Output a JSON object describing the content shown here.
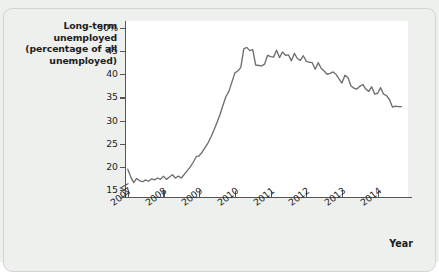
{
  "figure": {
    "background_color": "#eef0ee",
    "plot_background_color": "#ffffff",
    "axis_color": "#565656",
    "line_color": "#6e6e6e",
    "text_color": "#1d1d1d"
  },
  "chart_data": {
    "type": "line",
    "title": "",
    "ylabel": "Long-term unemployed (percentage of all unemployed)",
    "ylabel_lines": [
      "Long-term unemployed",
      "(percentage of all",
      "unemployed)"
    ],
    "xlabel": "Year",
    "ytick_labels": [
      "50%",
      "45",
      "40",
      "35",
      "30",
      "25",
      "20",
      "15"
    ],
    "ytick_values": [
      50,
      45,
      40,
      35,
      30,
      25,
      20,
      15
    ],
    "ylim": [
      13.5,
      51.5
    ],
    "y_axis_broken": true,
    "xtick_labels": [
      "2007",
      "2008",
      "2009",
      "2010",
      "2011",
      "2012",
      "2013",
      "2014"
    ],
    "xtick_values": [
      2007,
      2008,
      2009,
      2010,
      2011,
      2012,
      2013,
      2014
    ],
    "xlim": [
      2006.95,
      2014.85
    ],
    "grid": false,
    "legend": null,
    "series": [
      {
        "name": "Long-term unemployed share",
        "x": [
          2007.0,
          2007.083,
          2007.167,
          2007.25,
          2007.333,
          2007.417,
          2007.5,
          2007.583,
          2007.667,
          2007.75,
          2007.833,
          2007.917,
          2008.0,
          2008.083,
          2008.167,
          2008.25,
          2008.333,
          2008.417,
          2008.5,
          2008.583,
          2008.667,
          2008.75,
          2008.833,
          2008.917,
          2009.0,
          2009.083,
          2009.167,
          2009.25,
          2009.333,
          2009.417,
          2009.5,
          2009.583,
          2009.667,
          2009.75,
          2009.833,
          2009.917,
          2010.0,
          2010.083,
          2010.167,
          2010.25,
          2010.333,
          2010.417,
          2010.5,
          2010.583,
          2010.667,
          2010.75,
          2010.833,
          2010.917,
          2011.0,
          2011.083,
          2011.167,
          2011.25,
          2011.333,
          2011.417,
          2011.5,
          2011.583,
          2011.667,
          2011.75,
          2011.833,
          2011.917,
          2012.0,
          2012.083,
          2012.167,
          2012.25,
          2012.333,
          2012.417,
          2012.5,
          2012.583,
          2012.667,
          2012.75,
          2012.833,
          2012.917,
          2013.0,
          2013.083,
          2013.167,
          2013.25,
          2013.333,
          2013.417,
          2013.5,
          2013.583,
          2013.667,
          2013.75,
          2013.833,
          2013.917,
          2014.0,
          2014.083,
          2014.167,
          2014.25,
          2014.333,
          2014.417,
          2014.5,
          2014.583,
          2014.667
        ],
        "values": [
          19.5,
          17.8,
          16.6,
          17.5,
          17.0,
          16.8,
          17.2,
          16.9,
          17.4,
          17.2,
          17.6,
          17.3,
          18.0,
          17.3,
          17.8,
          18.3,
          17.6,
          18.0,
          17.6,
          18.4,
          19.2,
          20.0,
          21.0,
          22.2,
          22.4,
          23.2,
          24.2,
          25.2,
          26.5,
          28.0,
          29.6,
          31.3,
          33.3,
          35.2,
          36.3,
          38.3,
          40.3,
          40.7,
          41.5,
          45.5,
          45.8,
          45.1,
          45.3,
          42.0,
          41.9,
          41.8,
          42.2,
          44.1,
          43.8,
          43.7,
          45.2,
          43.6,
          44.8,
          44.1,
          44.2,
          42.9,
          44.5,
          43.4,
          43.0,
          44.0,
          42.8,
          42.6,
          42.5,
          41.1,
          42.5,
          41.3,
          40.7,
          40.0,
          40.2,
          40.5,
          40.0,
          39.0,
          38.1,
          39.8,
          39.3,
          37.5,
          37.0,
          36.8,
          37.4,
          37.8,
          36.8,
          36.3,
          37.3,
          35.7,
          35.9,
          37.1,
          35.7,
          35.4,
          34.5,
          32.9,
          33.1,
          33.0,
          33.0
        ]
      }
    ]
  }
}
